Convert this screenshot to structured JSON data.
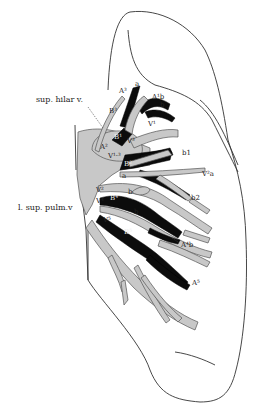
{
  "diagram": {
    "title": "",
    "colors": {
      "vein_fill": "#c8c8c8",
      "artery_bronchus_fill": "#0c0c0c",
      "outline": "#333333",
      "background": "#ffffff"
    },
    "labels": {
      "sup_hilar_v": "sup. hilar v.",
      "l_sup_pulm_v": "l. sup. pulm.v",
      "a3": "A³",
      "a3_a": "a",
      "a1b": "A¹b",
      "a1b_b": "b",
      "b3": "B³",
      "b1": "B¹",
      "v1": "V¹",
      "a2": "A²",
      "v3": "V³",
      "v13": "V¹·³",
      "b2_upper": "B²",
      "b1_small": "b1",
      "v2a": "V²a",
      "a_small": "a",
      "b2_small": "b2",
      "v2": "V²",
      "v4": "V⁴",
      "b4": "B⁴",
      "b_mid": "b",
      "b_mid2": "b",
      "v5": "V⁵",
      "b5": "B⁵",
      "a4b": "A⁴b",
      "a5": "A⁵"
    }
  }
}
